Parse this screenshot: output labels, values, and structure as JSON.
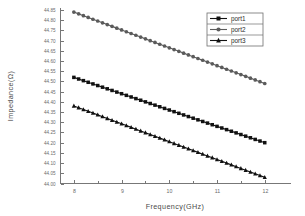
{
  "chart_data": {
    "type": "line",
    "title": "",
    "subtitle": "",
    "xlabel": "Frequency(GHz)",
    "ylabel": "Impedance(Ω)",
    "xlim": [
      7.72,
      12.55
    ],
    "ylim": [
      44.0,
      44.86
    ],
    "grid": false,
    "legend_position": "top-right",
    "x_ticks": [
      8,
      9,
      10,
      11,
      12
    ],
    "x_tick_labels": [
      "8",
      "9",
      "10",
      "11",
      "12"
    ],
    "x_minor_ticks": [
      8.5,
      9.5,
      10.5,
      11.5
    ],
    "y_ticks": [
      44.0,
      44.05,
      44.1,
      44.15,
      44.2,
      44.25,
      44.3,
      44.35,
      44.4,
      44.45,
      44.5,
      44.55,
      44.6,
      44.65,
      44.7,
      44.75,
      44.8,
      44.85
    ],
    "y_tick_labels": [
      "44.00",
      "44.05",
      "44.10",
      "44.15",
      "44.20",
      "44.25",
      "44.30",
      "44.35",
      "44.40",
      "44.45",
      "44.50",
      "44.55",
      "44.60",
      "44.65",
      "44.70",
      "44.75",
      "44.80",
      "44.85"
    ],
    "x": [
      8.0,
      8.1,
      8.2,
      8.3,
      8.4,
      8.5,
      8.6,
      8.7,
      8.8,
      8.9,
      9.0,
      9.1,
      9.2,
      9.3,
      9.4,
      9.5,
      9.6,
      9.7,
      9.8,
      9.9,
      10.0,
      10.1,
      10.2,
      10.3,
      10.4,
      10.5,
      10.6,
      10.7,
      10.8,
      10.9,
      11.0,
      11.1,
      11.2,
      11.3,
      11.4,
      11.5,
      11.6,
      11.7,
      11.8,
      11.9,
      12.0
    ],
    "series": [
      {
        "name": "port1",
        "marker": "square",
        "color": "#111111",
        "values": [
          44.52,
          44.512,
          44.504,
          44.496,
          44.488,
          44.48,
          44.472,
          44.464,
          44.456,
          44.448,
          44.44,
          44.432,
          44.424,
          44.416,
          44.408,
          44.4,
          44.392,
          44.384,
          44.376,
          44.368,
          44.36,
          44.352,
          44.344,
          44.336,
          44.328,
          44.32,
          44.312,
          44.304,
          44.296,
          44.288,
          44.28,
          44.272,
          44.264,
          44.256,
          44.248,
          44.24,
          44.232,
          44.224,
          44.216,
          44.208,
          44.2
        ]
      },
      {
        "name": "port2",
        "marker": "circle",
        "color": "#5b5b5b",
        "values": [
          44.84,
          44.8313,
          44.8225,
          44.8138,
          44.805,
          44.7963,
          44.7875,
          44.7788,
          44.77,
          44.7613,
          44.7525,
          44.7438,
          44.735,
          44.7263,
          44.7175,
          44.7088,
          44.7,
          44.6913,
          44.6825,
          44.6738,
          44.665,
          44.6563,
          44.6475,
          44.6388,
          44.63,
          44.6213,
          44.6125,
          44.6038,
          44.595,
          44.5863,
          44.5775,
          44.5688,
          44.56,
          44.5513,
          44.5425,
          44.5338,
          44.525,
          44.5163,
          44.5075,
          44.4988,
          44.49
        ]
      },
      {
        "name": "port3",
        "marker": "triangle",
        "color": "#111111",
        "values": [
          44.38,
          44.3713,
          44.3625,
          44.3538,
          44.345,
          44.3363,
          44.3275,
          44.3188,
          44.31,
          44.3013,
          44.2925,
          44.2838,
          44.275,
          44.2663,
          44.2575,
          44.2488,
          44.24,
          44.2313,
          44.2225,
          44.2138,
          44.205,
          44.1963,
          44.1875,
          44.1788,
          44.17,
          44.1613,
          44.1525,
          44.1438,
          44.135,
          44.1263,
          44.1175,
          44.1088,
          44.1,
          44.0913,
          44.0825,
          44.0738,
          44.065,
          44.0563,
          44.0475,
          44.0388,
          44.03
        ]
      }
    ],
    "legend": [
      {
        "label": "port1",
        "marker": "square",
        "color": "#111111"
      },
      {
        "label": "port2",
        "marker": "circle",
        "color": "#5b5b5b"
      },
      {
        "label": "port3",
        "marker": "triangle",
        "color": "#111111"
      }
    ]
  }
}
